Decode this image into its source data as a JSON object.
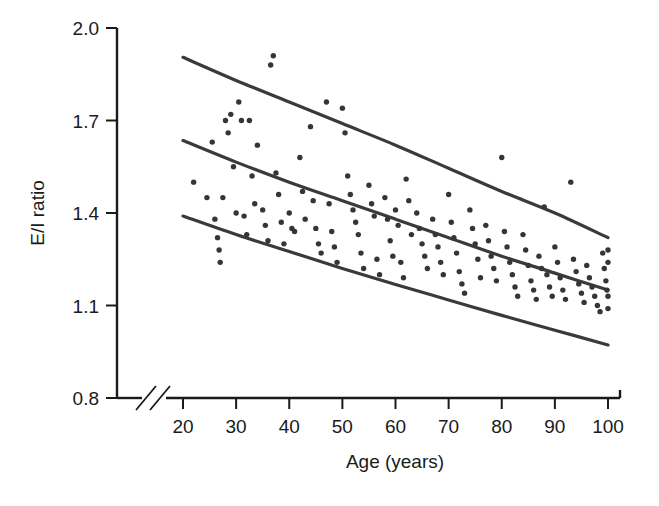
{
  "chart_data": {
    "type": "scatter",
    "title": "",
    "xlabel": "Age (years)",
    "ylabel": "E/I ratio",
    "xlim": [
      20,
      100
    ],
    "ylim": [
      0.8,
      2.0
    ],
    "xticks": [
      20,
      30,
      40,
      50,
      60,
      70,
      80,
      90,
      100
    ],
    "xtick_labels": [
      "20",
      "30",
      "40",
      "50",
      "60",
      "70",
      "80",
      "90",
      "100"
    ],
    "yticks": [
      0.8,
      1.1,
      1.4,
      1.7,
      2.0
    ],
    "ytick_labels": [
      "0.8",
      "1.1",
      "1.4",
      "1.7",
      "2.0"
    ],
    "grid": false,
    "legend": null,
    "axis_break": {
      "axis": "x",
      "after_value": 20,
      "style": "double-slash"
    },
    "point_color": "#353535",
    "curve_color": "#3a3a3a",
    "axis_color": "#1a1a1a",
    "series": [
      {
        "name": "E/I ratio vs age",
        "marker": "circle",
        "points": [
          [
            22.0,
            1.5
          ],
          [
            24.5,
            1.45
          ],
          [
            25.5,
            1.63
          ],
          [
            26.0,
            1.38
          ],
          [
            26.5,
            1.32
          ],
          [
            26.8,
            1.28
          ],
          [
            27.0,
            1.24
          ],
          [
            27.5,
            1.45
          ],
          [
            28.0,
            1.7
          ],
          [
            28.5,
            1.66
          ],
          [
            29.0,
            1.72
          ],
          [
            29.5,
            1.55
          ],
          [
            30.0,
            1.4
          ],
          [
            30.5,
            1.76
          ],
          [
            31.0,
            1.7
          ],
          [
            31.5,
            1.39
          ],
          [
            32.0,
            1.33
          ],
          [
            32.5,
            1.7
          ],
          [
            33.0,
            1.52
          ],
          [
            33.5,
            1.43
          ],
          [
            34.0,
            1.62
          ],
          [
            35.0,
            1.41
          ],
          [
            35.5,
            1.36
          ],
          [
            36.0,
            1.31
          ],
          [
            36.5,
            1.88
          ],
          [
            37.0,
            1.91
          ],
          [
            37.5,
            1.53
          ],
          [
            38.0,
            1.46
          ],
          [
            38.5,
            1.37
          ],
          [
            39.0,
            1.3
          ],
          [
            40.0,
            1.4
          ],
          [
            40.5,
            1.35
          ],
          [
            41.0,
            1.34
          ],
          [
            42.0,
            1.58
          ],
          [
            42.5,
            1.47
          ],
          [
            43.0,
            1.38
          ],
          [
            44.0,
            1.68
          ],
          [
            44.5,
            1.44
          ],
          [
            45.0,
            1.35
          ],
          [
            45.5,
            1.3
          ],
          [
            46.0,
            1.27
          ],
          [
            47.0,
            1.76
          ],
          [
            47.5,
            1.43
          ],
          [
            48.0,
            1.34
          ],
          [
            48.5,
            1.29
          ],
          [
            49.0,
            1.24
          ],
          [
            50.0,
            1.74
          ],
          [
            50.5,
            1.66
          ],
          [
            51.0,
            1.52
          ],
          [
            51.5,
            1.46
          ],
          [
            52.0,
            1.41
          ],
          [
            52.5,
            1.37
          ],
          [
            53.0,
            1.33
          ],
          [
            53.5,
            1.27
          ],
          [
            54.0,
            1.22
          ],
          [
            55.0,
            1.49
          ],
          [
            55.5,
            1.43
          ],
          [
            56.0,
            1.39
          ],
          [
            56.5,
            1.25
          ],
          [
            57.0,
            1.2
          ],
          [
            58.0,
            1.45
          ],
          [
            58.5,
            1.38
          ],
          [
            59.0,
            1.31
          ],
          [
            59.5,
            1.26
          ],
          [
            60.0,
            1.41
          ],
          [
            60.5,
            1.36
          ],
          [
            61.0,
            1.24
          ],
          [
            61.5,
            1.19
          ],
          [
            62.0,
            1.51
          ],
          [
            62.5,
            1.44
          ],
          [
            63.0,
            1.33
          ],
          [
            64.0,
            1.4
          ],
          [
            64.5,
            1.35
          ],
          [
            65.0,
            1.3
          ],
          [
            65.5,
            1.26
          ],
          [
            66.0,
            1.22
          ],
          [
            67.0,
            1.38
          ],
          [
            67.5,
            1.33
          ],
          [
            68.0,
            1.29
          ],
          [
            68.5,
            1.24
          ],
          [
            69.0,
            1.2
          ],
          [
            70.0,
            1.46
          ],
          [
            70.5,
            1.37
          ],
          [
            71.0,
            1.32
          ],
          [
            71.5,
            1.27
          ],
          [
            72.0,
            1.21
          ],
          [
            72.5,
            1.17
          ],
          [
            73.0,
            1.14
          ],
          [
            74.0,
            1.41
          ],
          [
            74.5,
            1.35
          ],
          [
            75.0,
            1.3
          ],
          [
            75.5,
            1.25
          ],
          [
            76.0,
            1.19
          ],
          [
            77.0,
            1.36
          ],
          [
            77.5,
            1.31
          ],
          [
            78.0,
            1.26
          ],
          [
            78.5,
            1.22
          ],
          [
            79.0,
            1.18
          ],
          [
            80.0,
            1.58
          ],
          [
            80.5,
            1.34
          ],
          [
            81.0,
            1.29
          ],
          [
            81.5,
            1.24
          ],
          [
            82.0,
            1.2
          ],
          [
            82.5,
            1.16
          ],
          [
            83.0,
            1.13
          ],
          [
            84.0,
            1.33
          ],
          [
            84.5,
            1.28
          ],
          [
            85.0,
            1.23
          ],
          [
            85.5,
            1.18
          ],
          [
            86.0,
            1.15
          ],
          [
            86.5,
            1.12
          ],
          [
            87.0,
            1.26
          ],
          [
            87.5,
            1.22
          ],
          [
            88.0,
            1.42
          ],
          [
            88.5,
            1.2
          ],
          [
            89.0,
            1.16
          ],
          [
            89.5,
            1.13
          ],
          [
            90.0,
            1.29
          ],
          [
            90.5,
            1.24
          ],
          [
            91.0,
            1.19
          ],
          [
            91.5,
            1.15
          ],
          [
            92.0,
            1.12
          ],
          [
            93.0,
            1.5
          ],
          [
            93.5,
            1.25
          ],
          [
            94.0,
            1.21
          ],
          [
            94.5,
            1.17
          ],
          [
            95.0,
            1.14
          ],
          [
            95.5,
            1.11
          ],
          [
            96.0,
            1.23
          ],
          [
            96.5,
            1.19
          ],
          [
            97.0,
            1.16
          ],
          [
            97.5,
            1.13
          ],
          [
            98.0,
            1.1
          ],
          [
            98.5,
            1.08
          ],
          [
            99.0,
            1.27
          ],
          [
            99.3,
            1.22
          ],
          [
            99.6,
            1.18
          ],
          [
            99.8,
            1.15
          ],
          [
            100.0,
            1.28
          ],
          [
            100.0,
            1.24
          ],
          [
            100.0,
            1.13
          ],
          [
            100.0,
            1.09
          ]
        ]
      }
    ],
    "reference_curves": [
      {
        "name": "upper-limit-curve",
        "points": [
          [
            20,
            1.905
          ],
          [
            30,
            1.83
          ],
          [
            40,
            1.76
          ],
          [
            50,
            1.69
          ],
          [
            60,
            1.62
          ],
          [
            70,
            1.545
          ],
          [
            80,
            1.47
          ],
          [
            90,
            1.4
          ],
          [
            100,
            1.32
          ]
        ]
      },
      {
        "name": "mean-curve",
        "points": [
          [
            20,
            1.635
          ],
          [
            30,
            1.565
          ],
          [
            40,
            1.5
          ],
          [
            50,
            1.44
          ],
          [
            60,
            1.38
          ],
          [
            70,
            1.32
          ],
          [
            80,
            1.26
          ],
          [
            90,
            1.205
          ],
          [
            100,
            1.15
          ]
        ]
      },
      {
        "name": "lower-limit-curve",
        "points": [
          [
            20,
            1.39
          ],
          [
            30,
            1.33
          ],
          [
            40,
            1.275
          ],
          [
            50,
            1.22
          ],
          [
            60,
            1.168
          ],
          [
            70,
            1.118
          ],
          [
            80,
            1.068
          ],
          [
            90,
            1.02
          ],
          [
            100,
            0.972
          ]
        ]
      }
    ]
  }
}
